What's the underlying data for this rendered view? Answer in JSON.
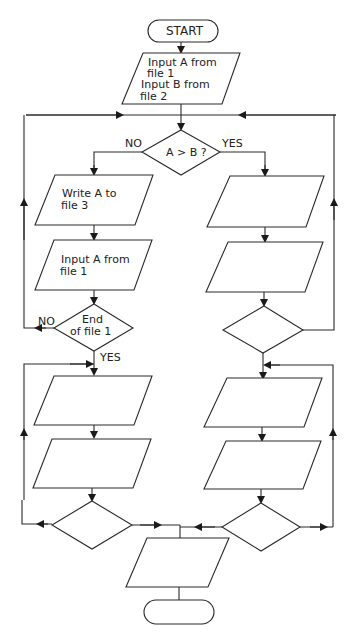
{
  "diagram": {
    "type": "flowchart",
    "nodes": {
      "start": {
        "shape": "terminator",
        "label": "START"
      },
      "input_ab": {
        "shape": "parallelogram",
        "line1": "Input A from",
        "line2": "file 1",
        "line3": "Input B from",
        "line4": "file 2"
      },
      "decision_ab": {
        "shape": "diamond",
        "label": "A > B ?"
      },
      "write_a": {
        "shape": "parallelogram",
        "line1": "Write A to",
        "line2": "file 3"
      },
      "input_a": {
        "shape": "parallelogram",
        "line1": "Input A from",
        "line2": "file 1"
      },
      "decision_eof1": {
        "shape": "diamond",
        "line1": "End",
        "line2": "of file 1"
      },
      "right_io_1": {
        "shape": "parallelogram",
        "label": ""
      },
      "right_io_2": {
        "shape": "parallelogram",
        "label": ""
      },
      "right_decision_1": {
        "shape": "diamond",
        "label": ""
      },
      "left_io_3": {
        "shape": "parallelogram",
        "label": ""
      },
      "left_io_4": {
        "shape": "parallelogram",
        "label": ""
      },
      "left_decision_2": {
        "shape": "diamond",
        "label": ""
      },
      "right_io_3": {
        "shape": "parallelogram",
        "label": ""
      },
      "right_io_4": {
        "shape": "parallelogram",
        "label": ""
      },
      "right_decision_2": {
        "shape": "diamond",
        "label": ""
      },
      "final_io": {
        "shape": "parallelogram",
        "label": ""
      },
      "stop": {
        "shape": "terminator",
        "label": ""
      }
    },
    "edge_labels": {
      "ab_no": "NO",
      "ab_yes": "YES",
      "eof_no": "NO",
      "eof_yes": "YES"
    },
    "colors": {
      "stroke": "#2a2a2a",
      "background": "#ffffff"
    }
  }
}
